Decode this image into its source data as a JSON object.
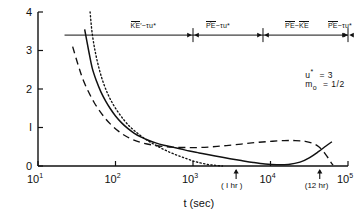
{
  "chart_data": {
    "type": "line",
    "title": "",
    "xlabel": "t (sec)",
    "ylabel": "",
    "xscale": "log",
    "yscale": "linear",
    "xlim": [
      10,
      100000
    ],
    "ylim": [
      0,
      4
    ],
    "grid": false,
    "legend_position": "none",
    "x_ticks": [
      {
        "value": 10,
        "label_base": "10",
        "label_exp": "1"
      },
      {
        "value": 100,
        "label_base": "10",
        "label_exp": "2"
      },
      {
        "value": 1000,
        "label_base": "10",
        "label_exp": "3"
      },
      {
        "value": 10000,
        "label_base": "10",
        "label_exp": "4"
      },
      {
        "value": 100000,
        "label_base": "10",
        "label_exp": "5"
      }
    ],
    "y_ticks": [
      {
        "value": 0,
        "label": "0"
      },
      {
        "value": 1,
        "label": "I"
      },
      {
        "value": 2,
        "label": "2"
      },
      {
        "value": 3,
        "label": "3"
      },
      {
        "value": 4,
        "label": "4"
      }
    ],
    "x_markers": [
      {
        "value": 3600,
        "label": "( I hr )"
      },
      {
        "value": 43200,
        "label": "(12 hr)"
      }
    ],
    "series": [
      {
        "name": "solid-curve",
        "style": "solid",
        "points": [
          [
            40,
            3.55
          ],
          [
            45,
            3.0
          ],
          [
            50,
            2.55
          ],
          [
            57,
            2.2
          ],
          [
            65,
            1.92
          ],
          [
            75,
            1.68
          ],
          [
            85,
            1.5
          ],
          [
            100,
            1.3
          ],
          [
            120,
            1.12
          ],
          [
            145,
            0.97
          ],
          [
            175,
            0.85
          ],
          [
            215,
            0.75
          ],
          [
            265,
            0.67
          ],
          [
            330,
            0.6
          ],
          [
            420,
            0.54
          ],
          [
            540,
            0.49
          ],
          [
            700,
            0.44
          ],
          [
            900,
            0.39
          ],
          [
            1200,
            0.34
          ],
          [
            1600,
            0.29
          ],
          [
            2200,
            0.24
          ],
          [
            3000,
            0.19
          ],
          [
            4200,
            0.14
          ],
          [
            6000,
            0.09
          ],
          [
            8500,
            0.05
          ],
          [
            12000,
            0.03
          ],
          [
            17000,
            0.04
          ],
          [
            24000,
            0.1
          ],
          [
            32000,
            0.22
          ],
          [
            42000,
            0.38
          ],
          [
            52000,
            0.52
          ],
          [
            62000,
            0.63
          ]
        ]
      },
      {
        "name": "dashed-curve",
        "style": "dashed",
        "points": [
          [
            28,
            3.1
          ],
          [
            33,
            2.62
          ],
          [
            38,
            2.25
          ],
          [
            45,
            1.92
          ],
          [
            53,
            1.65
          ],
          [
            63,
            1.42
          ],
          [
            75,
            1.22
          ],
          [
            90,
            1.05
          ],
          [
            110,
            0.9
          ],
          [
            135,
            0.78
          ],
          [
            170,
            0.68
          ],
          [
            220,
            0.6
          ],
          [
            290,
            0.55
          ],
          [
            400,
            0.51
          ],
          [
            560,
            0.49
          ],
          [
            800,
            0.48
          ],
          [
            1200,
            0.48
          ],
          [
            1800,
            0.5
          ],
          [
            2700,
            0.53
          ],
          [
            4200,
            0.57
          ],
          [
            6500,
            0.61
          ],
          [
            10000,
            0.64
          ],
          [
            15000,
            0.66
          ],
          [
            21000,
            0.66
          ],
          [
            28000,
            0.64
          ],
          [
            35000,
            0.59
          ],
          [
            42000,
            0.5
          ],
          [
            48000,
            0.38
          ],
          [
            54000,
            0.24
          ],
          [
            60000,
            0.1
          ],
          [
            64000,
            0.02
          ]
        ]
      },
      {
        "name": "dotted-curve",
        "style": "dotted",
        "points": [
          [
            47,
            4.0
          ],
          [
            50,
            3.45
          ],
          [
            55,
            2.95
          ],
          [
            62,
            2.5
          ],
          [
            70,
            2.15
          ],
          [
            80,
            1.86
          ],
          [
            92,
            1.62
          ],
          [
            108,
            1.4
          ],
          [
            128,
            1.2
          ],
          [
            152,
            1.03
          ],
          [
            182,
            0.89
          ],
          [
            220,
            0.76
          ],
          [
            270,
            0.64
          ],
          [
            330,
            0.54
          ],
          [
            410,
            0.44
          ],
          [
            510,
            0.35
          ],
          [
            640,
            0.27
          ],
          [
            800,
            0.2
          ],
          [
            1000,
            0.13
          ],
          [
            1250,
            0.08
          ],
          [
            1550,
            0.04
          ],
          [
            1900,
            0.02
          ],
          [
            2400,
            0.0
          ]
        ]
      }
    ],
    "regime_bar": {
      "y_value": 3.4,
      "dividers": [
        1000,
        8000,
        450000
      ],
      "left_end": 22,
      "right_end": 120000,
      "regimes": [
        {
          "id": "regime-1",
          "quantity": "KE",
          "dot": true,
          "prime": true,
          "relation": "~",
          "target": "τu*",
          "target_dot": false,
          "x_center": 230
        },
        {
          "id": "regime-2",
          "quantity": "PE",
          "dot": true,
          "prime": false,
          "relation": "~",
          "target": "τu*",
          "target_dot": false,
          "x_center": 2100
        },
        {
          "id": "regime-3",
          "quantity": "PE",
          "dot": true,
          "prime": false,
          "relation": "~",
          "target": "KE",
          "target_dot": true,
          "x_center": 22000
        },
        {
          "id": "regime-4",
          "quantity": "PE",
          "dot": true,
          "prime": false,
          "relation": "~",
          "target": "τu*",
          "target_dot": false,
          "x_center": 230000
        }
      ]
    },
    "annotations": [
      {
        "id": "param-ustar",
        "symbol": "u",
        "symbol_sup": "*",
        "symbol_sub": "",
        "equals": "= 3",
        "x_value": 28000,
        "y_value": 2.42
      },
      {
        "id": "param-m0",
        "symbol": "m",
        "symbol_sup": "",
        "symbol_sub": "o",
        "equals": "= 1/2",
        "x_value": 28000,
        "y_value": 2.1
      }
    ]
  }
}
